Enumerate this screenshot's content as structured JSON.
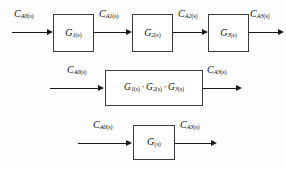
{
  "diagram": {
    "background_color": "#fdfdfd",
    "line_color": "#1a1a1a",
    "box_border_color": "#3a3a3a",
    "rows": [
      {
        "id": "row-cascade",
        "signals": [
          {
            "id": "sig-ca0-r1",
            "base": "C",
            "sub": "A0",
            "arg": "(s)"
          },
          {
            "id": "sig-ca1-r1",
            "base": "C",
            "sub": "A1",
            "arg": "(s)"
          },
          {
            "id": "sig-ca2-r1",
            "base": "C",
            "sub": "A2",
            "arg": "(s)"
          },
          {
            "id": "sig-ca3-r1",
            "base": "C",
            "sub": "A3",
            "arg": "(s)"
          }
        ],
        "blocks": [
          {
            "id": "block-g1",
            "base": "G",
            "sub": "1",
            "arg": "(s)"
          },
          {
            "id": "block-g2",
            "base": "G",
            "sub": "2",
            "arg": "(s)"
          },
          {
            "id": "block-g3",
            "base": "G",
            "sub": "3",
            "arg": "(s)"
          }
        ]
      },
      {
        "id": "row-product",
        "signals": [
          {
            "id": "sig-ca0-r2",
            "base": "C",
            "sub": "A0",
            "arg": "(s)"
          },
          {
            "id": "sig-ca3-r2",
            "base": "C",
            "sub": "A3",
            "arg": "(s)"
          }
        ],
        "blocks": [
          {
            "id": "block-g1g2g3",
            "factors": [
              {
                "base": "G",
                "sub": "1",
                "arg": "(s)"
              },
              {
                "base": "G",
                "sub": "2",
                "arg": "(s)"
              },
              {
                "base": "G",
                "sub": "3",
                "arg": "(s)"
              }
            ],
            "separator": "·"
          }
        ]
      },
      {
        "id": "row-combined",
        "signals": [
          {
            "id": "sig-ca0-r3",
            "base": "C",
            "sub": "A0",
            "arg": "(s)"
          },
          {
            "id": "sig-ca3-r3",
            "base": "C",
            "sub": "A3",
            "arg": "(s)"
          }
        ],
        "blocks": [
          {
            "id": "block-g",
            "base": "G",
            "sub": "",
            "arg": "(s)"
          }
        ]
      }
    ]
  }
}
